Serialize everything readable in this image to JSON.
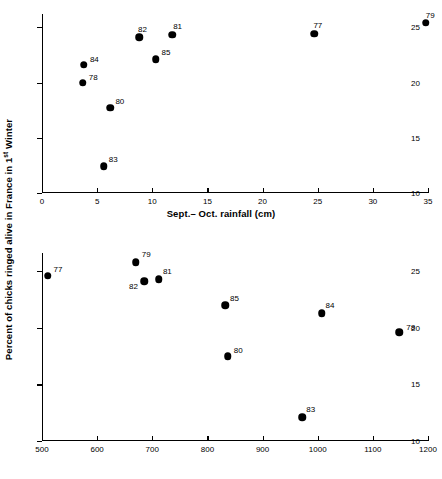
{
  "figure": {
    "y_axis_label_prefix": "Percent of chicks ringed alive in France in 1",
    "y_axis_label_sup": "st",
    "y_axis_label_suffix": " Winter"
  },
  "chart_data": [
    {
      "type": "scatter",
      "title": "",
      "xlabel": "Sept.– Oct. rainfall (cm)",
      "ylabel": "Percent of chicks ringed alive in France in 1st Winter",
      "xlim": [
        0,
        35
      ],
      "ylim": [
        10,
        26.2
      ],
      "xticks": [
        0,
        5,
        10,
        15,
        20,
        25,
        30,
        35
      ],
      "xticklabels": [
        "0",
        "5",
        "10",
        "15",
        "20",
        "25",
        "30",
        "35"
      ],
      "yticks": [
        10,
        15,
        20,
        25
      ],
      "yticklabels": [
        "10",
        "15",
        "20",
        "25"
      ],
      "grid": false,
      "legend": "none",
      "points": [
        {
          "label": "84",
          "x": 3.8,
          "y": 21.6,
          "label_dx": 6,
          "label_dy": -10
        },
        {
          "label": "78",
          "x": 3.7,
          "y": 20.0,
          "label_dx": 6,
          "label_dy": -10
        },
        {
          "label": "80",
          "x": 6.2,
          "y": 17.7,
          "label_dx": 5,
          "label_dy": -11
        },
        {
          "label": "83",
          "x": 5.6,
          "y": 12.4,
          "label_dx": 5,
          "label_dy": -11
        },
        {
          "label": "82",
          "x": 8.8,
          "y": 24.1,
          "label_dx": -1,
          "label_dy": -12
        },
        {
          "label": "85",
          "x": 10.3,
          "y": 22.1,
          "label_dx": 6,
          "label_dy": -11
        },
        {
          "label": "81",
          "x": 11.8,
          "y": 24.3,
          "label_dx": 1,
          "label_dy": -13
        },
        {
          "label": "77",
          "x": 24.7,
          "y": 24.4,
          "label_dx": -1,
          "label_dy": -13
        },
        {
          "label": "79",
          "x": 34.8,
          "y": 25.4,
          "label_dx": 0,
          "label_dy": -12
        }
      ]
    },
    {
      "type": "scatter",
      "title": "",
      "xlabel": "Tunis tailsum",
      "ylabel": "Percent of chicks ringed alive in France in 1st Winter",
      "xlim": [
        500,
        1200
      ],
      "ylim": [
        10,
        26.6
      ],
      "xticks": [
        500,
        600,
        700,
        800,
        900,
        1000,
        1100,
        1200
      ],
      "xticklabels": [
        "500",
        "600",
        "700",
        "800",
        "900",
        "1000",
        "1100",
        "1200"
      ],
      "yticks": [
        10,
        15,
        20,
        25
      ],
      "yticklabels": [
        "10",
        "15",
        "20",
        "25"
      ],
      "grid": false,
      "legend": "none",
      "points": [
        {
          "label": "77",
          "x": 510,
          "y": 24.6,
          "label_dx": 6,
          "label_dy": -11
        },
        {
          "label": "79",
          "x": 670,
          "y": 25.8,
          "label_dx": 6,
          "label_dy": -12
        },
        {
          "label": "82",
          "x": 685,
          "y": 24.1,
          "label_dx": -15,
          "label_dy": 1
        },
        {
          "label": "81",
          "x": 712,
          "y": 24.3,
          "label_dx": 4,
          "label_dy": -12
        },
        {
          "label": "85",
          "x": 832,
          "y": 22.0,
          "label_dx": 5,
          "label_dy": -11
        },
        {
          "label": "80",
          "x": 837,
          "y": 17.5,
          "label_dx": 6,
          "label_dy": -10
        },
        {
          "label": "84",
          "x": 1007,
          "y": 21.3,
          "label_dx": 4,
          "label_dy": -12
        },
        {
          "label": "78",
          "x": 1148,
          "y": 19.6,
          "label_dx": 7,
          "label_dy": -9
        },
        {
          "label": "83",
          "x": 972,
          "y": 12.1,
          "label_dx": 4,
          "label_dy": -12
        }
      ]
    }
  ]
}
